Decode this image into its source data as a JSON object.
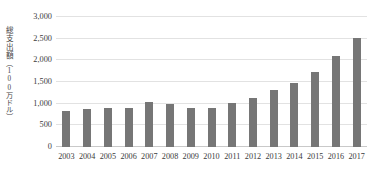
{
  "chart_data": {
    "type": "bar",
    "title": "",
    "xlabel": "",
    "ylabel": "総支出額（100万ドル）",
    "ylabel_main": "総支出額",
    "ylabel_unit": "（100万ドル）",
    "categories": [
      "2003",
      "2004",
      "2005",
      "2006",
      "2007",
      "2008",
      "2009",
      "2010",
      "2011",
      "2012",
      "2013",
      "2014",
      "2015",
      "2016",
      "2017"
    ],
    "values": [
      830,
      880,
      890,
      900,
      1040,
      1000,
      900,
      900,
      1010,
      1130,
      1310,
      1470,
      1730,
      2090,
      2520
    ],
    "series": [
      {
        "name": "総支出額",
        "values": [
          830,
          880,
          890,
          900,
          1040,
          1000,
          900,
          900,
          1010,
          1130,
          1310,
          1470,
          1730,
          2090,
          2520
        ]
      }
    ],
    "ylim": [
      0,
      3000
    ],
    "y_ticks": [
      0,
      500,
      1000,
      1500,
      2000,
      2500,
      3000
    ],
    "y_tick_labels": [
      "0",
      "500",
      "1,000",
      "1,500",
      "2,000",
      "2,500",
      "3,000"
    ],
    "grid": true,
    "legend": "none",
    "bar_color": "#767676",
    "gridline_color": "#e2e2e2",
    "axis_color": "#c9c9c9",
    "text_color": "#3b3b3b"
  }
}
